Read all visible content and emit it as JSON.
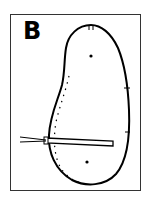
{
  "figure": {
    "panel_label": "B",
    "colors": {
      "stroke": "#000000",
      "frame": "#333333",
      "background": "#ffffff"
    },
    "elements": [
      {
        "type": "bean-outline",
        "description": "kidney/bean-shaped closed outline"
      },
      {
        "type": "dotted-line",
        "description": "inner dotted line along left edge"
      },
      {
        "type": "dot",
        "description": "upper center dot"
      },
      {
        "type": "dot",
        "description": "lower center dot"
      },
      {
        "type": "needle",
        "description": "horizontal rod inserted from left through outline"
      },
      {
        "type": "tick-marks",
        "description": "small marks on outline at top and right side"
      }
    ]
  }
}
